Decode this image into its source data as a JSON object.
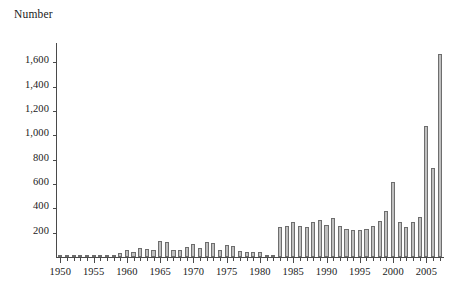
{
  "chart_data": {
    "type": "bar",
    "title": "",
    "ylabel": "Number",
    "xlabel": "",
    "ylim": [
      0,
      1750
    ],
    "xlim": [
      1949.5,
      2007.5
    ],
    "grid": false,
    "legend": false,
    "ytick_labels": [
      "1,600",
      "1,400",
      "1,200",
      "1,000",
      "800",
      "600",
      "400",
      "200"
    ],
    "ytick_values": [
      1600,
      1400,
      1200,
      1000,
      800,
      600,
      400,
      200
    ],
    "xtick_labels": [
      "1950",
      "1955",
      "1960",
      "1965",
      "1970",
      "1975",
      "1980",
      "1985",
      "1990",
      "1995",
      "2000",
      "2005"
    ],
    "xtick_values": [
      1950,
      1955,
      1960,
      1965,
      1970,
      1975,
      1980,
      1985,
      1990,
      1995,
      2000,
      2005
    ],
    "bar_fill_color": "#bfbfbf",
    "bar_edge_color": "#6e6e6e",
    "axis_color": "#4a4a4a",
    "categories": [
      1950,
      1951,
      1952,
      1953,
      1954,
      1955,
      1956,
      1957,
      1958,
      1959,
      1960,
      1961,
      1962,
      1963,
      1964,
      1965,
      1966,
      1967,
      1968,
      1969,
      1970,
      1971,
      1972,
      1973,
      1974,
      1975,
      1976,
      1977,
      1978,
      1979,
      1980,
      1981,
      1982,
      1983,
      1984,
      1985,
      1986,
      1987,
      1988,
      1989,
      1990,
      1991,
      1992,
      1993,
      1994,
      1995,
      1996,
      1997,
      1998,
      1999,
      2000,
      2001,
      2002,
      2003,
      2004,
      2005,
      2006,
      2007
    ],
    "values": [
      4,
      3,
      3,
      4,
      5,
      4,
      6,
      5,
      20,
      30,
      55,
      45,
      70,
      65,
      55,
      130,
      120,
      60,
      55,
      80,
      110,
      70,
      125,
      115,
      60,
      95,
      90,
      50,
      45,
      45,
      40,
      12,
      10,
      250,
      255,
      290,
      255,
      250,
      285,
      305,
      265,
      320,
      255,
      230,
      225,
      220,
      230,
      255,
      300,
      375,
      615,
      290,
      250,
      290,
      330,
      1080,
      730,
      1670
    ]
  }
}
